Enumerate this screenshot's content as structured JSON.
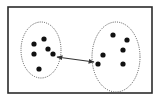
{
  "diagram": {
    "type": "cluster-distance",
    "colors": {
      "background": "#ffffff",
      "frame": "#2b2b2b",
      "ellipse": "#555555",
      "dot": "#111111",
      "arrow": "#333333"
    },
    "frame": {
      "x": 8,
      "y": 7,
      "width": 144,
      "height": 86
    },
    "clusters": [
      {
        "name": "left-cluster",
        "ellipse": {
          "cx": 41,
          "cy": 50,
          "rx": 20,
          "ry": 28
        },
        "points": [
          {
            "x": 44,
            "y": 39
          },
          {
            "x": 34,
            "y": 44
          },
          {
            "x": 48,
            "y": 49
          },
          {
            "x": 34,
            "y": 54
          },
          {
            "x": 53,
            "y": 54
          },
          {
            "x": 39,
            "y": 69
          }
        ]
      },
      {
        "name": "right-cluster",
        "ellipse": {
          "cx": 116,
          "cy": 57,
          "rx": 24,
          "ry": 35
        },
        "points": [
          {
            "x": 113,
            "y": 35
          },
          {
            "x": 127,
            "y": 40
          },
          {
            "x": 123,
            "y": 50
          },
          {
            "x": 103,
            "y": 55
          },
          {
            "x": 98,
            "y": 64
          },
          {
            "x": 123,
            "y": 64
          }
        ]
      }
    ],
    "link": {
      "x1": 57,
      "y1": 57,
      "x2": 94,
      "y2": 62,
      "style": "double-headed-arrow"
    }
  }
}
